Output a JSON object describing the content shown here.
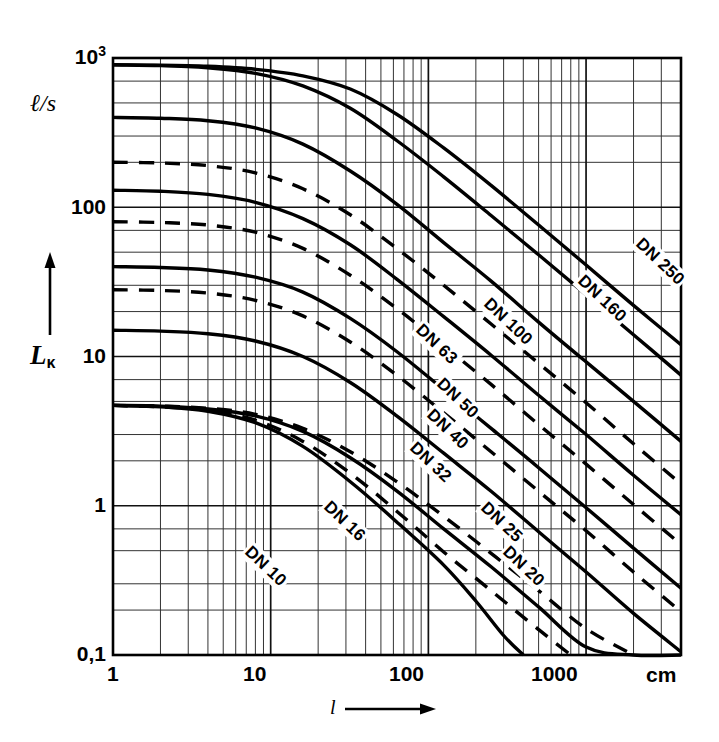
{
  "figure": {
    "unit_label": "ℓ/s",
    "y_axis_title_main": "L",
    "y_axis_title_sub": "κ",
    "x_axis_title": "l",
    "x_unit": "cm",
    "arrow_up": "↑",
    "arrow_right": "→"
  },
  "chart_data": {
    "type": "line",
    "title": "",
    "xlabel": "l",
    "ylabel": "Lκ",
    "x_unit": "cm",
    "y_unit": "ℓ/s",
    "xscale": "log",
    "yscale": "log",
    "xlim": [
      1,
      4000
    ],
    "ylim": [
      0.1,
      1000
    ],
    "grid": true,
    "x_tick_labels": [
      "1",
      "10",
      "100",
      "1000"
    ],
    "x_tick_values": [
      1,
      10,
      100,
      1000
    ],
    "y_tick_labels": [
      "0,1",
      "1",
      "10",
      "100",
      "10³"
    ],
    "y_tick_values": [
      0.1,
      1,
      10,
      100,
      1000
    ],
    "legend_position": "inline-on-curves",
    "series": [
      {
        "name": "DN 250",
        "label": "DN 250",
        "style": "solid",
        "label_x": 2100,
        "label_y": 60,
        "points": [
          [
            1,
            900
          ],
          [
            2,
            895
          ],
          [
            4,
            880
          ],
          [
            8,
            840
          ],
          [
            16,
            760
          ],
          [
            32,
            620
          ],
          [
            63,
            420
          ],
          [
            125,
            250
          ],
          [
            250,
            140
          ],
          [
            500,
            76
          ],
          [
            1000,
            41
          ],
          [
            2000,
            22
          ],
          [
            4000,
            12
          ]
        ]
      },
      {
        "name": "DN 160",
        "label": "DN 160",
        "style": "solid",
        "label_x": 900,
        "label_y": 34,
        "points": [
          [
            1,
            900
          ],
          [
            2,
            890
          ],
          [
            4,
            860
          ],
          [
            8,
            790
          ],
          [
            16,
            650
          ],
          [
            32,
            460
          ],
          [
            63,
            280
          ],
          [
            125,
            160
          ],
          [
            250,
            88
          ],
          [
            500,
            48
          ],
          [
            1000,
            26
          ],
          [
            2000,
            14
          ],
          [
            4000,
            7.5
          ]
        ]
      },
      {
        "name": "DN 100",
        "label": "DN 100",
        "style": "solid",
        "label_x": 230,
        "label_y": 24,
        "points": [
          [
            1,
            400
          ],
          [
            2,
            395
          ],
          [
            4,
            380
          ],
          [
            8,
            340
          ],
          [
            16,
            265
          ],
          [
            32,
            175
          ],
          [
            63,
            105
          ],
          [
            125,
            58
          ],
          [
            250,
            32
          ],
          [
            500,
            17
          ],
          [
            1000,
            9.2
          ],
          [
            2000,
            5
          ],
          [
            4000,
            2.7
          ]
        ]
      },
      {
        "name": "DN 63",
        "label": "DN 63",
        "style": "solid",
        "label_x": 85,
        "label_y": 16,
        "points": [
          [
            1,
            130
          ],
          [
            2,
            128
          ],
          [
            4,
            122
          ],
          [
            8,
            108
          ],
          [
            16,
            84
          ],
          [
            32,
            56
          ],
          [
            63,
            33
          ],
          [
            125,
            18.5
          ],
          [
            250,
            10.2
          ],
          [
            500,
            5.5
          ],
          [
            1000,
            3.0
          ],
          [
            2000,
            1.6
          ],
          [
            4000,
            0.87
          ]
        ]
      },
      {
        "name": "DN 50",
        "label": "DN 50",
        "style": "solid",
        "label_x": 115,
        "label_y": 7.0,
        "points": [
          [
            1,
            40
          ],
          [
            2,
            39.5
          ],
          [
            4,
            38
          ],
          [
            8,
            34
          ],
          [
            16,
            27
          ],
          [
            32,
            18
          ],
          [
            63,
            10.8
          ],
          [
            125,
            6.0
          ],
          [
            250,
            3.3
          ],
          [
            500,
            1.8
          ],
          [
            1000,
            0.97
          ],
          [
            2000,
            0.52
          ],
          [
            4000,
            0.28
          ]
        ]
      },
      {
        "name": "DN 32",
        "label": "DN 32",
        "style": "solid",
        "label_x": 78,
        "label_y": 2.6,
        "points": [
          [
            1,
            15
          ],
          [
            2,
            14.8
          ],
          [
            4,
            14.2
          ],
          [
            8,
            12.7
          ],
          [
            16,
            10
          ],
          [
            32,
            6.7
          ],
          [
            63,
            4.0
          ],
          [
            125,
            2.25
          ],
          [
            250,
            1.25
          ],
          [
            500,
            0.67
          ],
          [
            1000,
            0.36
          ],
          [
            2000,
            0.19
          ],
          [
            4000,
            0.105
          ]
        ]
      },
      {
        "name": "DN 16",
        "label": "DN 16",
        "style": "solid",
        "label_x": 22,
        "label_y": 1.05,
        "points": [
          [
            1,
            4.7
          ],
          [
            2,
            4.65
          ],
          [
            4,
            4.45
          ],
          [
            8,
            4.0
          ],
          [
            16,
            3.15
          ],
          [
            32,
            2.1
          ],
          [
            63,
            1.26
          ],
          [
            125,
            0.7
          ],
          [
            250,
            0.39
          ],
          [
            500,
            0.21
          ],
          [
            1000,
            0.113
          ],
          [
            2000,
            0.1
          ],
          [
            4000,
            0.1
          ]
        ]
      },
      {
        "name": "DN 10",
        "label": "DN 10",
        "style": "solid",
        "label_x": 7,
        "label_y": 0.52,
        "points": [
          [
            1,
            4.7
          ],
          [
            2,
            4.6
          ],
          [
            4,
            4.3
          ],
          [
            8,
            3.6
          ],
          [
            16,
            2.5
          ],
          [
            32,
            1.45
          ],
          [
            63,
            0.78
          ],
          [
            125,
            0.4
          ],
          [
            200,
            0.23
          ],
          [
            300,
            0.135
          ],
          [
            400,
            0.1
          ]
        ]
      },
      {
        "name": "DN 160 dashed",
        "label": "",
        "style": "dashed",
        "points": [
          [
            1,
            200
          ],
          [
            2,
            198
          ],
          [
            4,
            190
          ],
          [
            8,
            170
          ],
          [
            16,
            133
          ],
          [
            32,
            89
          ],
          [
            63,
            53
          ],
          [
            125,
            30
          ],
          [
            250,
            16.5
          ],
          [
            500,
            9.0
          ],
          [
            1000,
            4.9
          ],
          [
            2000,
            2.6
          ],
          [
            4000,
            1.4
          ]
        ]
      },
      {
        "name": "DN 63 dashed",
        "label": "",
        "style": "dashed",
        "points": [
          [
            1,
            80
          ],
          [
            2,
            79
          ],
          [
            4,
            76
          ],
          [
            8,
            68
          ],
          [
            16,
            53
          ],
          [
            32,
            35
          ],
          [
            63,
            21
          ],
          [
            125,
            11.8
          ],
          [
            250,
            6.5
          ],
          [
            500,
            3.5
          ],
          [
            1000,
            1.9
          ],
          [
            2000,
            1.02
          ],
          [
            4000,
            0.55
          ]
        ]
      },
      {
        "name": "DN 40",
        "label": "DN 40",
        "style": "dashed",
        "label_x": 100,
        "label_y": 4.3,
        "points": [
          [
            1,
            28
          ],
          [
            2,
            27.7
          ],
          [
            4,
            26.6
          ],
          [
            8,
            23.8
          ],
          [
            16,
            18.7
          ],
          [
            32,
            12.5
          ],
          [
            63,
            7.5
          ],
          [
            125,
            4.2
          ],
          [
            250,
            2.3
          ],
          [
            500,
            1.25
          ],
          [
            1000,
            0.68
          ],
          [
            2000,
            0.36
          ],
          [
            4000,
            0.195
          ]
        ]
      },
      {
        "name": "DN 25",
        "label": "DN 25",
        "style": "dashed",
        "label_x": 220,
        "label_y": 1.02,
        "points": [
          [
            1,
            4.7
          ],
          [
            2,
            4.65
          ],
          [
            4,
            4.5
          ],
          [
            8,
            4.1
          ],
          [
            16,
            3.3
          ],
          [
            32,
            2.3
          ],
          [
            63,
            1.45
          ],
          [
            125,
            0.85
          ],
          [
            250,
            0.48
          ],
          [
            500,
            0.27
          ],
          [
            1000,
            0.15
          ],
          [
            2000,
            0.1
          ]
        ]
      },
      {
        "name": "DN 20",
        "label": "DN 20",
        "style": "dashed",
        "label_x": 300,
        "label_y": 0.52,
        "points": [
          [
            1,
            4.7
          ],
          [
            2,
            4.6
          ],
          [
            4,
            4.35
          ],
          [
            8,
            3.75
          ],
          [
            16,
            2.7
          ],
          [
            32,
            1.65
          ],
          [
            63,
            0.92
          ],
          [
            125,
            0.49
          ],
          [
            250,
            0.27
          ],
          [
            500,
            0.148
          ],
          [
            800,
            0.1
          ]
        ]
      }
    ]
  }
}
